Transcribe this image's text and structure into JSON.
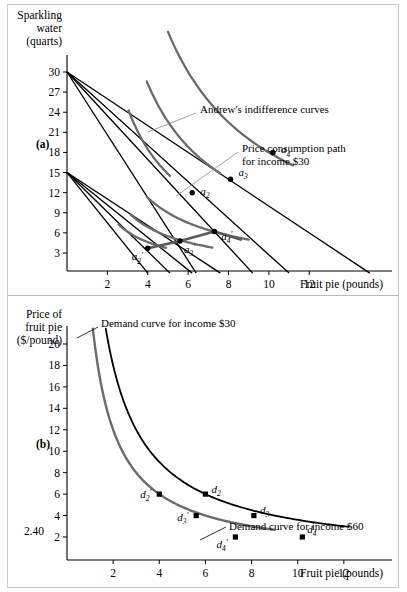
{
  "figure": {
    "panels": [
      {
        "id": "a",
        "panel_label": "(a)",
        "y_axis_title_lines": [
          "Sparkling",
          "water",
          "(quarts)"
        ],
        "x_axis_title": "Fruit pie (pounds)",
        "annotations": [
          {
            "name": "indifference-curves-label",
            "text": "Andrew's indifference curves"
          },
          {
            "name": "price-consumption-path-label",
            "text_line1": "Price consumption path",
            "text_line2": "for income $30"
          }
        ],
        "chart_data": {
          "type": "line",
          "title": "Andrew's indifference curves and budget lines",
          "xlabel": "Fruit pie (pounds)",
          "ylabel": "Sparkling water (quarts)",
          "xlim": [
            0,
            16
          ],
          "ylim": [
            0,
            32
          ],
          "xticks": [
            2,
            4,
            6,
            8,
            10,
            12
          ],
          "yticks": [
            3,
            6,
            9,
            12,
            15,
            18,
            21,
            24,
            27,
            30
          ],
          "grid": false,
          "legend": "none",
          "budget_lines": [
            {
              "name": "budget-30-p1",
              "income": 30,
              "y_intercept": 30,
              "x_intercept": 15.0,
              "color": "#000000"
            },
            {
              "name": "budget-30-p2",
              "income": 30,
              "y_intercept": 30,
              "x_intercept": 11.0,
              "color": "#000000"
            },
            {
              "name": "budget-30-p3",
              "income": 30,
              "y_intercept": 30,
              "x_intercept": 9.2,
              "color": "#000000"
            },
            {
              "name": "budget-30-p4",
              "income": 30,
              "y_intercept": 30,
              "x_intercept": 6.4,
              "color": "#000000"
            },
            {
              "name": "budget-15-p1",
              "income": 15,
              "y_intercept": 15,
              "x_intercept": 7.6,
              "color": "#000000"
            },
            {
              "name": "budget-15-p2",
              "income": 15,
              "y_intercept": 15,
              "x_intercept": 6.2,
              "color": "#000000"
            },
            {
              "name": "budget-15-p3",
              "income": 15,
              "y_intercept": 15,
              "x_intercept": 5.1,
              "color": "#000000"
            },
            {
              "name": "budget-15-p4",
              "income": 15,
              "y_intercept": 15,
              "x_intercept": 4.0,
              "color": "#000000"
            }
          ],
          "indifference_curves": [
            {
              "name": "indifference-curve-a2",
              "k": 74,
              "x_from": 3.05,
              "x_to": 5.1,
              "color": "#6b6b6b"
            },
            {
              "name": "indifference-curve-a3",
              "k": 113,
              "x_from": 3.95,
              "x_to": 7.6,
              "color": "#6b6b6b"
            },
            {
              "name": "indifference-curve-a4",
              "k": 180,
              "x_from": 5.0,
              "x_to": 11.2,
              "color": "#6b6b6b"
            },
            {
              "name": "indifference-curve-a2-prime",
              "k": 18.5,
              "x_from": 2.55,
              "x_to": 4.9,
              "color": "#6b6b6b"
            },
            {
              "name": "indifference-curve-a3-prime",
              "k": 27.5,
              "x_from": 3.15,
              "x_to": 7.2,
              "color": "#6b6b6b"
            },
            {
              "name": "indifference-curve-a4-prime",
              "k": 45,
              "x_from": 3.95,
              "x_to": 9.0,
              "color": "#6b6b6b"
            }
          ],
          "price_consumption_path": {
            "name": "price-consumption-path-curve",
            "points": [
              [
                4.0,
                3.7
              ],
              [
                5.6,
                4.8
              ],
              [
                7.3,
                6.2
              ],
              [
                8.6,
                5.0
              ]
            ],
            "color": "#5a5a5a"
          },
          "points": [
            {
              "label": "a",
              "sub": "2",
              "prime": false,
              "x": 6.2,
              "y": 12.0,
              "label_dx": 8,
              "label_dy": 2
            },
            {
              "label": "a",
              "sub": "3",
              "prime": false,
              "x": 8.1,
              "y": 14.0,
              "label_dx": 8,
              "label_dy": -3
            },
            {
              "label": "a",
              "sub": "4",
              "prime": false,
              "x": 10.2,
              "y": 18.0,
              "label_dx": 8,
              "label_dy": 1
            },
            {
              "label": "a",
              "sub": "2",
              "prime": true,
              "x": 4.0,
              "y": 3.7,
              "label_dx": -16,
              "label_dy": 12
            },
            {
              "label": "a",
              "sub": "3",
              "prime": true,
              "x": 5.6,
              "y": 4.8,
              "label_dx": 4,
              "label_dy": 12
            },
            {
              "label": "a",
              "sub": "4",
              "prime": true,
              "x": 7.3,
              "y": 6.2,
              "label_dx": 7,
              "label_dy": 8
            }
          ]
        }
      },
      {
        "id": "b",
        "panel_label": "(b)",
        "y_axis_title_lines": [
          "Price of",
          "fruit pie",
          "($/pound)"
        ],
        "x_axis_title": "Fruit pie (pounds)",
        "special_tick_label": "2.40",
        "annotations": [
          {
            "name": "demand-curve-income-30-label",
            "text": "Demand curve for income $30"
          },
          {
            "name": "demand-curve-income-60-label",
            "text": "Demand curve for income $60"
          }
        ],
        "chart_data": {
          "type": "line",
          "title": "Andrew's demand curves for fruit pie",
          "xlabel": "Fruit pie (pounds)",
          "ylabel": "Price of fruit pie ($/pound)",
          "xlim": [
            0,
            14
          ],
          "ylim": [
            0,
            22
          ],
          "xticks": [
            2,
            4,
            6,
            8,
            10,
            12
          ],
          "yticks": [
            2,
            4,
            6,
            8,
            10,
            12,
            14,
            16,
            18,
            20
          ],
          "grid": false,
          "legend": "none",
          "curves": [
            {
              "name": "demand-curve-income-30",
              "label": "Demand curve for income $30",
              "income": 30,
              "k": 24,
              "x_from": 1.12,
              "x_to": 9.0,
              "color": "#6b6b6b",
              "width": 2.4
            },
            {
              "name": "demand-curve-income-60",
              "label": "Demand curve for income $60",
              "income": 60,
              "k": 36,
              "x_from": 1.68,
              "x_to": 12.2,
              "color": "#000000",
              "width": 1.8
            }
          ],
          "points": [
            {
              "label": "d",
              "sub": "2",
              "prime": true,
              "x": 4.0,
              "y": 6.0,
              "label_dx": -19,
              "label_dy": 4
            },
            {
              "label": "d",
              "sub": "3",
              "prime": true,
              "x": 5.6,
              "y": 4.0,
              "label_dx": -19,
              "label_dy": 5
            },
            {
              "label": "d",
              "sub": "4",
              "prime": true,
              "x": 7.3,
              "y": 2.0,
              "label_dx": -19,
              "label_dy": 11
            },
            {
              "label": "d",
              "sub": "2",
              "prime": false,
              "x": 6.0,
              "y": 6.0,
              "label_dx": 6,
              "label_dy": -1
            },
            {
              "label": "d",
              "sub": "3",
              "prime": false,
              "x": 8.1,
              "y": 4.0,
              "label_dx": 6,
              "label_dy": -2
            },
            {
              "label": "d",
              "sub": "4",
              "prime": false,
              "x": 10.2,
              "y": 2.0,
              "label_dx": 5,
              "label_dy": -4
            }
          ]
        }
      }
    ]
  }
}
